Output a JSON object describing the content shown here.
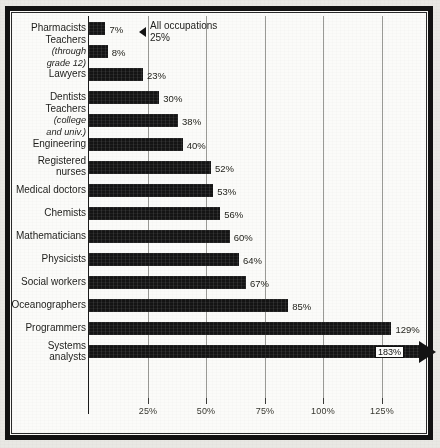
{
  "chart_data": {
    "type": "bar",
    "orientation": "horizontal",
    "title": "",
    "xlabel": "",
    "ylabel": "",
    "xlim": [
      0,
      143
    ],
    "grid": true,
    "legend": "none",
    "tick_labels": [
      "25%",
      "50%",
      "75%",
      "100%",
      "125%"
    ],
    "tick_values": [
      25,
      50,
      75,
      100,
      125
    ],
    "categories": [
      "Pharmacists",
      "Teachers",
      "Lawyers",
      "Dentists",
      "Teachers",
      "Engineering",
      "Registered nurses",
      "Medical doctors",
      "Chemists",
      "Mathematicians",
      "Physicists",
      "Social workers",
      "Oceanographers",
      "Programmers",
      "Systems analysts"
    ],
    "values": [
      7,
      8,
      23,
      30,
      38,
      40,
      52,
      53,
      56,
      60,
      64,
      67,
      85,
      129,
      183
    ],
    "value_labels": [
      "7%",
      "8%",
      "23%",
      "30%",
      "38%",
      "40%",
      "52%",
      "53%",
      "56%",
      "60%",
      "64%",
      "67%",
      "85%",
      "129%",
      "183%"
    ],
    "annotations": [
      {
        "name": "all-occupations-reference",
        "line1": "All occupations",
        "line2": "25%",
        "value": 25,
        "marker": "left-triangle"
      }
    ],
    "overflow_bar": {
      "category": "Systems analysts",
      "value": 183,
      "label": "183%",
      "note": "bar extends past axis, drawn with arrowhead"
    }
  },
  "rows": [
    {
      "name": "pharmacists",
      "label_main": "Pharmacists",
      "label_sub": "",
      "value": 7,
      "value_label": "7%"
    },
    {
      "name": "teachers-k12",
      "label_main": "Teachers",
      "label_sub": "(through\ngrade 12)",
      "value": 8,
      "value_label": "8%"
    },
    {
      "name": "lawyers",
      "label_main": "Lawyers",
      "label_sub": "",
      "value": 23,
      "value_label": "23%"
    },
    {
      "name": "dentists",
      "label_main": "Dentists",
      "label_sub": "",
      "value": 30,
      "value_label": "30%"
    },
    {
      "name": "teachers-college",
      "label_main": "Teachers",
      "label_sub": "(college\nand univ.)",
      "value": 38,
      "value_label": "38%"
    },
    {
      "name": "engineering",
      "label_main": "Engineering",
      "label_sub": "",
      "value": 40,
      "value_label": "40%"
    },
    {
      "name": "registered-nurses",
      "label_main": "Registered\nnurses",
      "label_sub": "",
      "value": 52,
      "value_label": "52%"
    },
    {
      "name": "medical-doctors",
      "label_main": "Medical doctors",
      "label_sub": "",
      "value": 53,
      "value_label": "53%"
    },
    {
      "name": "chemists",
      "label_main": "Chemists",
      "label_sub": "",
      "value": 56,
      "value_label": "56%"
    },
    {
      "name": "mathematicians",
      "label_main": "Mathematicians",
      "label_sub": "",
      "value": 60,
      "value_label": "60%"
    },
    {
      "name": "physicists",
      "label_main": "Physicists",
      "label_sub": "",
      "value": 64,
      "value_label": "64%"
    },
    {
      "name": "social-workers",
      "label_main": "Social workers",
      "label_sub": "",
      "value": 67,
      "value_label": "67%"
    },
    {
      "name": "oceanographers",
      "label_main": "Oceanographers",
      "label_sub": "",
      "value": 85,
      "value_label": "85%"
    },
    {
      "name": "programmers",
      "label_main": "Programmers",
      "label_sub": "",
      "value": 129,
      "value_label": "129%"
    },
    {
      "name": "systems-analysts",
      "label_main": "Systems\nanalysts",
      "label_sub": "",
      "value": 183,
      "value_label": "183%"
    }
  ],
  "axis": {
    "ticks": [
      {
        "name": "tick-25",
        "label": "25%"
      },
      {
        "name": "tick-50",
        "label": "50%"
      },
      {
        "name": "tick-75",
        "label": "75%"
      },
      {
        "name": "tick-100",
        "label": "100%"
      },
      {
        "name": "tick-125",
        "label": "125%"
      }
    ]
  },
  "annotation": {
    "line1": "All occupations",
    "line2": "25%"
  },
  "colors": {
    "bar": "#141414",
    "grid": "#9a9a96",
    "text": "#1d1d1a",
    "paper": "#fbfaf7",
    "frame": "#121212"
  }
}
